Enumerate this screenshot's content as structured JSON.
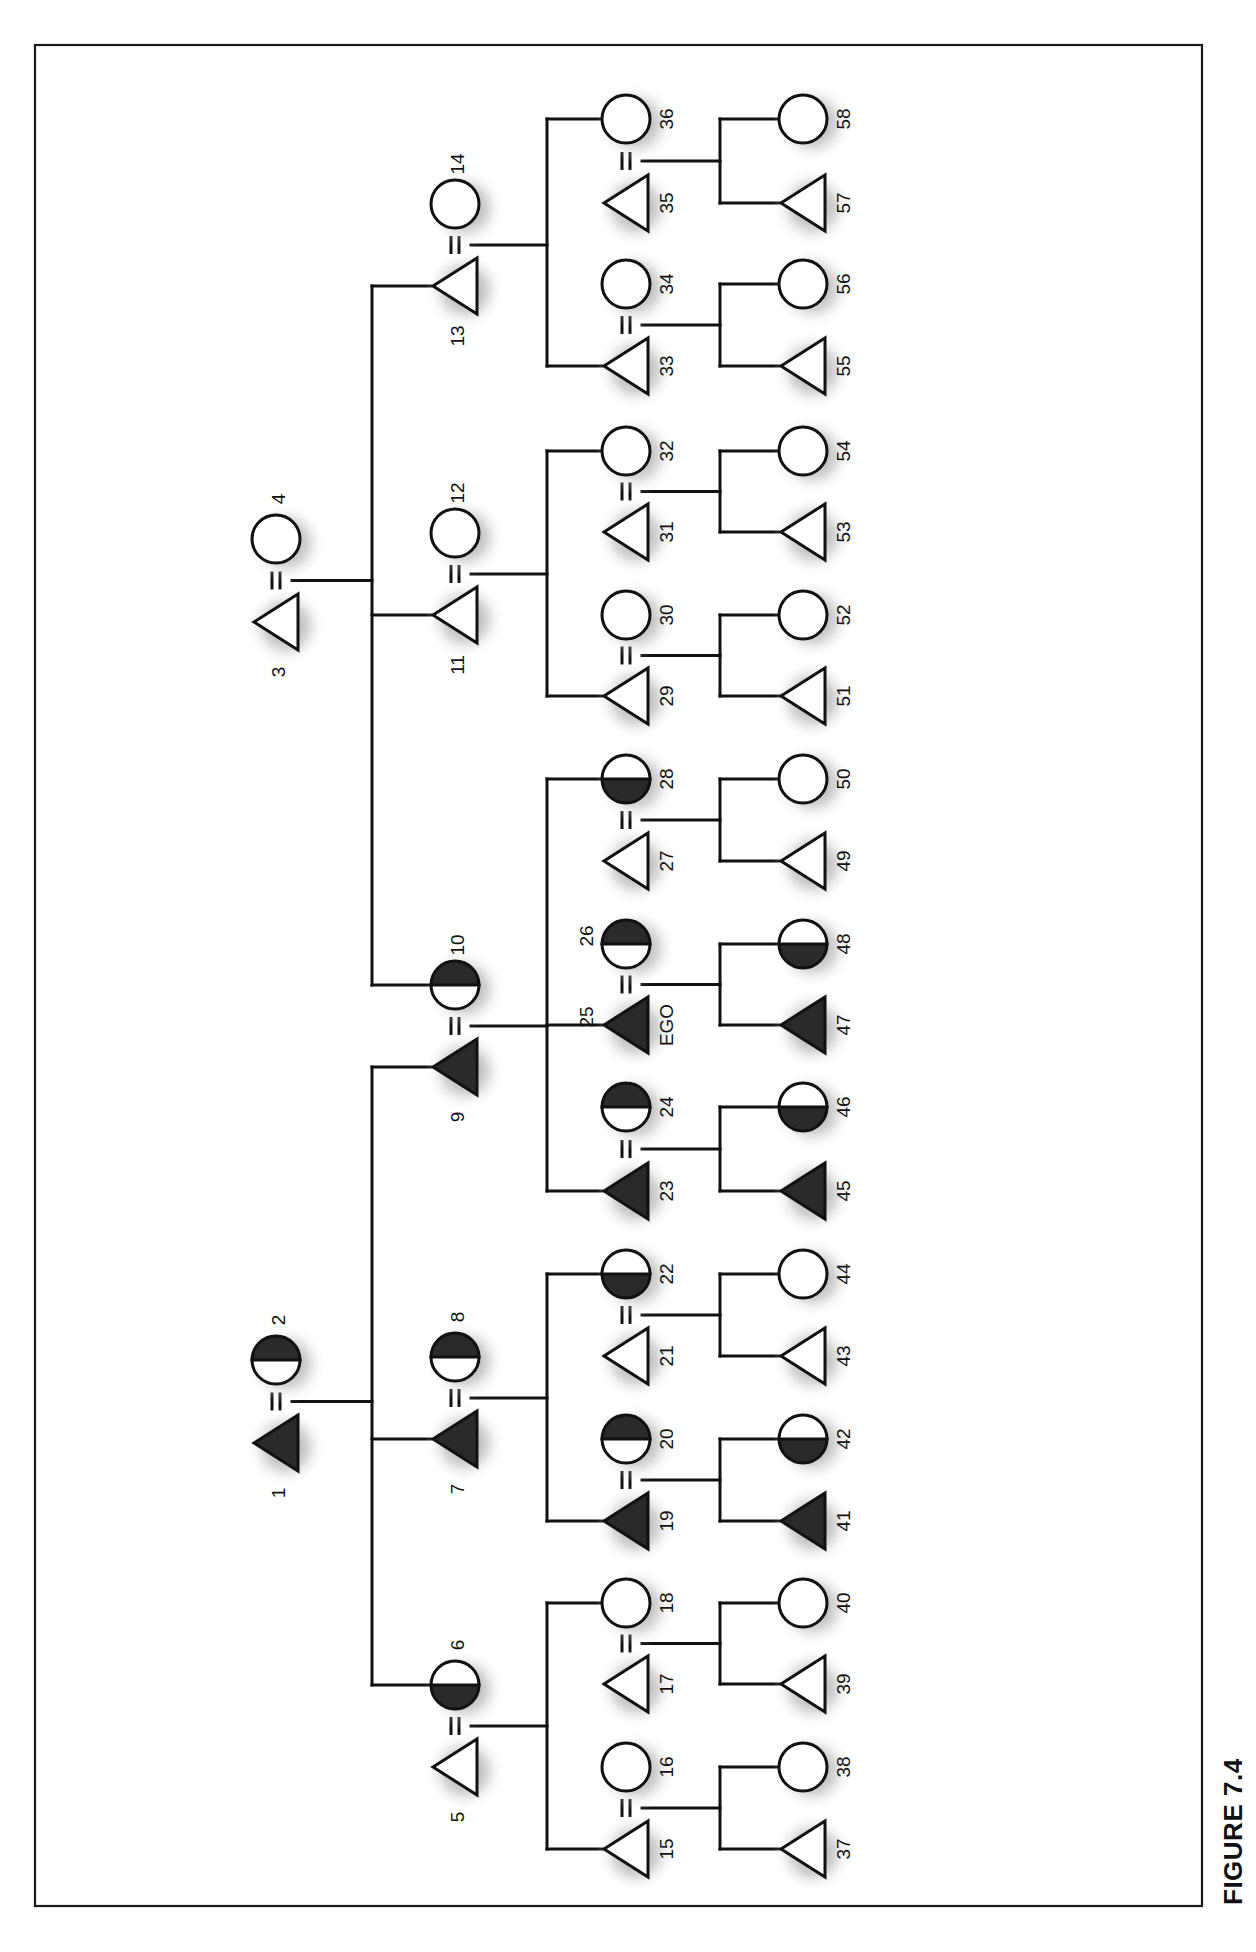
{
  "figure": {
    "caption": "FIGURE 7.4",
    "colors": {
      "ink": "#111111",
      "fill_dark": "#2a2a2a",
      "fill_light": "#ffffff",
      "halo": "#9a9a9a"
    }
  },
  "legend_semantics": {
    "triangle": "male",
    "circle": "female",
    "equals": "marriage",
    "solid": "fully shaded (patrilineal line)",
    "half_top": "top half shaded (in-marrying wife)",
    "half_bottom": "bottom half shaded (daughter of shaded line)"
  },
  "nodes": [
    {
      "id": 1,
      "label": "1",
      "sex": "male",
      "fill": "solid",
      "gen": 1,
      "row": 1443,
      "label_pos": "below"
    },
    {
      "id": 2,
      "label": "2",
      "sex": "female",
      "fill": "half_top",
      "gen": 1,
      "row": 1360,
      "label_pos": "above"
    },
    {
      "id": 3,
      "label": "3",
      "sex": "male",
      "fill": "none",
      "gen": 1,
      "row": 622,
      "label_pos": "below"
    },
    {
      "id": 4,
      "label": "4",
      "sex": "female",
      "fill": "none",
      "gen": 1,
      "row": 539,
      "label_pos": "above"
    },
    {
      "id": 5,
      "label": "5",
      "sex": "male",
      "fill": "none",
      "gen": 2,
      "row": 1767,
      "label_pos": "below"
    },
    {
      "id": 6,
      "label": "6",
      "sex": "female",
      "fill": "half_bottom",
      "gen": 2,
      "row": 1685,
      "label_pos": "above"
    },
    {
      "id": 7,
      "label": "7",
      "sex": "male",
      "fill": "solid",
      "gen": 2,
      "row": 1439,
      "label_pos": "below"
    },
    {
      "id": 8,
      "label": "8",
      "sex": "female",
      "fill": "half_top",
      "gen": 2,
      "row": 1357,
      "label_pos": "above"
    },
    {
      "id": 9,
      "label": "9",
      "sex": "male",
      "fill": "solid",
      "gen": 2,
      "row": 1067,
      "label_pos": "below"
    },
    {
      "id": 10,
      "label": "10",
      "sex": "female",
      "fill": "half_top",
      "gen": 2,
      "row": 985,
      "label_pos": "above"
    },
    {
      "id": 11,
      "label": "11",
      "sex": "male",
      "fill": "none",
      "gen": 2,
      "row": 615,
      "label_pos": "below"
    },
    {
      "id": 12,
      "label": "12",
      "sex": "female",
      "fill": "none",
      "gen": 2,
      "row": 533,
      "label_pos": "above"
    },
    {
      "id": 13,
      "label": "13",
      "sex": "male",
      "fill": "none",
      "gen": 2,
      "row": 286,
      "label_pos": "below"
    },
    {
      "id": 14,
      "label": "14",
      "sex": "female",
      "fill": "none",
      "gen": 2,
      "row": 204,
      "label_pos": "above"
    },
    {
      "id": 15,
      "label": "15",
      "sex": "male",
      "fill": "none",
      "gen": 3,
      "row": 1849,
      "label_pos": "right"
    },
    {
      "id": 16,
      "label": "16",
      "sex": "female",
      "fill": "none",
      "gen": 3,
      "row": 1767,
      "label_pos": "right"
    },
    {
      "id": 17,
      "label": "17",
      "sex": "male",
      "fill": "none",
      "gen": 3,
      "row": 1684,
      "label_pos": "right"
    },
    {
      "id": 18,
      "label": "18",
      "sex": "female",
      "fill": "none",
      "gen": 3,
      "row": 1603,
      "label_pos": "right"
    },
    {
      "id": 19,
      "label": "19",
      "sex": "male",
      "fill": "solid",
      "gen": 3,
      "row": 1521,
      "label_pos": "right"
    },
    {
      "id": 20,
      "label": "20",
      "sex": "female",
      "fill": "half_top",
      "gen": 3,
      "row": 1439,
      "label_pos": "right"
    },
    {
      "id": 21,
      "label": "21",
      "sex": "male",
      "fill": "none",
      "gen": 3,
      "row": 1356,
      "label_pos": "right"
    },
    {
      "id": 22,
      "label": "22",
      "sex": "female",
      "fill": "half_bottom",
      "gen": 3,
      "row": 1274,
      "label_pos": "right"
    },
    {
      "id": 23,
      "label": "23",
      "sex": "male",
      "fill": "solid",
      "gen": 3,
      "row": 1191,
      "label_pos": "right"
    },
    {
      "id": 24,
      "label": "24",
      "sex": "female",
      "fill": "half_top",
      "gen": 3,
      "row": 1107,
      "label_pos": "right"
    },
    {
      "id": 25,
      "label": "25",
      "sex": "male",
      "fill": "solid",
      "gen": 3,
      "row": 1025,
      "label_pos": "left",
      "extra_label": "EGO"
    },
    {
      "id": 26,
      "label": "26",
      "sex": "female",
      "fill": "half_top",
      "gen": 3,
      "row": 944,
      "label_pos": "left"
    },
    {
      "id": 27,
      "label": "27",
      "sex": "male",
      "fill": "none",
      "gen": 3,
      "row": 861,
      "label_pos": "right"
    },
    {
      "id": 28,
      "label": "28",
      "sex": "female",
      "fill": "half_bottom",
      "gen": 3,
      "row": 779,
      "label_pos": "right"
    },
    {
      "id": 29,
      "label": "29",
      "sex": "male",
      "fill": "none",
      "gen": 3,
      "row": 696,
      "label_pos": "right"
    },
    {
      "id": 30,
      "label": "30",
      "sex": "female",
      "fill": "none",
      "gen": 3,
      "row": 615,
      "label_pos": "right"
    },
    {
      "id": 31,
      "label": "31",
      "sex": "male",
      "fill": "none",
      "gen": 3,
      "row": 532,
      "label_pos": "right"
    },
    {
      "id": 32,
      "label": "32",
      "sex": "female",
      "fill": "none",
      "gen": 3,
      "row": 451,
      "label_pos": "right"
    },
    {
      "id": 33,
      "label": "33",
      "sex": "male",
      "fill": "none",
      "gen": 3,
      "row": 366,
      "label_pos": "right"
    },
    {
      "id": 34,
      "label": "34",
      "sex": "female",
      "fill": "none",
      "gen": 3,
      "row": 284,
      "label_pos": "right"
    },
    {
      "id": 35,
      "label": "35",
      "sex": "male",
      "fill": "none",
      "gen": 3,
      "row": 203,
      "label_pos": "right"
    },
    {
      "id": 36,
      "label": "36",
      "sex": "female",
      "fill": "none",
      "gen": 3,
      "row": 119,
      "label_pos": "right"
    },
    {
      "id": 37,
      "label": "37",
      "sex": "male",
      "fill": "none",
      "gen": 4,
      "row": 1849,
      "label_pos": "right"
    },
    {
      "id": 38,
      "label": "38",
      "sex": "female",
      "fill": "none",
      "gen": 4,
      "row": 1767,
      "label_pos": "right"
    },
    {
      "id": 39,
      "label": "39",
      "sex": "male",
      "fill": "none",
      "gen": 4,
      "row": 1684,
      "label_pos": "right"
    },
    {
      "id": 40,
      "label": "40",
      "sex": "female",
      "fill": "none",
      "gen": 4,
      "row": 1603,
      "label_pos": "right"
    },
    {
      "id": 41,
      "label": "41",
      "sex": "male",
      "fill": "solid",
      "gen": 4,
      "row": 1521,
      "label_pos": "right"
    },
    {
      "id": 42,
      "label": "42",
      "sex": "female",
      "fill": "half_bottom",
      "gen": 4,
      "row": 1439,
      "label_pos": "right"
    },
    {
      "id": 43,
      "label": "43",
      "sex": "male",
      "fill": "none",
      "gen": 4,
      "row": 1356,
      "label_pos": "right"
    },
    {
      "id": 44,
      "label": "44",
      "sex": "female",
      "fill": "none",
      "gen": 4,
      "row": 1274,
      "label_pos": "right"
    },
    {
      "id": 45,
      "label": "45",
      "sex": "male",
      "fill": "solid",
      "gen": 4,
      "row": 1191,
      "label_pos": "right"
    },
    {
      "id": 46,
      "label": "46",
      "sex": "female",
      "fill": "half_bottom",
      "gen": 4,
      "row": 1107,
      "label_pos": "right"
    },
    {
      "id": 47,
      "label": "47",
      "sex": "male",
      "fill": "solid",
      "gen": 4,
      "row": 1025,
      "label_pos": "right"
    },
    {
      "id": 48,
      "label": "48",
      "sex": "female",
      "fill": "half_bottom",
      "gen": 4,
      "row": 944,
      "label_pos": "right"
    },
    {
      "id": 49,
      "label": "49",
      "sex": "male",
      "fill": "none",
      "gen": 4,
      "row": 861,
      "label_pos": "right"
    },
    {
      "id": 50,
      "label": "50",
      "sex": "female",
      "fill": "none",
      "gen": 4,
      "row": 779,
      "label_pos": "right"
    },
    {
      "id": 51,
      "label": "51",
      "sex": "male",
      "fill": "none",
      "gen": 4,
      "row": 696,
      "label_pos": "right"
    },
    {
      "id": 52,
      "label": "52",
      "sex": "female",
      "fill": "none",
      "gen": 4,
      "row": 615,
      "label_pos": "right"
    },
    {
      "id": 53,
      "label": "53",
      "sex": "male",
      "fill": "none",
      "gen": 4,
      "row": 532,
      "label_pos": "right"
    },
    {
      "id": 54,
      "label": "54",
      "sex": "female",
      "fill": "none",
      "gen": 4,
      "row": 451,
      "label_pos": "right"
    },
    {
      "id": 55,
      "label": "55",
      "sex": "male",
      "fill": "none",
      "gen": 4,
      "row": 366,
      "label_pos": "right"
    },
    {
      "id": 56,
      "label": "56",
      "sex": "female",
      "fill": "none",
      "gen": 4,
      "row": 284,
      "label_pos": "right"
    },
    {
      "id": 57,
      "label": "57",
      "sex": "male",
      "fill": "none",
      "gen": 4,
      "row": 203,
      "label_pos": "right"
    },
    {
      "id": 58,
      "label": "58",
      "sex": "female",
      "fill": "none",
      "gen": 4,
      "row": 119,
      "label_pos": "right"
    }
  ],
  "marriages": [
    {
      "husband": 1,
      "wife": 2,
      "children": [
        9,
        7,
        6
      ]
    },
    {
      "husband": 3,
      "wife": 4,
      "children": [
        13,
        11,
        10
      ]
    },
    {
      "husband": 5,
      "wife": 6,
      "children": [
        15,
        18
      ]
    },
    {
      "husband": 7,
      "wife": 8,
      "children": [
        19,
        22
      ]
    },
    {
      "husband": 9,
      "wife": 10,
      "children": [
        23,
        25,
        28
      ]
    },
    {
      "husband": 11,
      "wife": 12,
      "children": [
        29,
        32
      ]
    },
    {
      "husband": 13,
      "wife": 14,
      "children": [
        33,
        36
      ]
    },
    {
      "husband": 15,
      "wife": 16,
      "children": [
        37,
        38
      ]
    },
    {
      "husband": 17,
      "wife": 18,
      "children": [
        39,
        40
      ]
    },
    {
      "husband": 19,
      "wife": 20,
      "children": [
        41,
        42
      ]
    },
    {
      "husband": 21,
      "wife": 22,
      "children": [
        43,
        44
      ]
    },
    {
      "husband": 23,
      "wife": 24,
      "children": [
        45,
        46
      ]
    },
    {
      "husband": 25,
      "wife": 26,
      "children": [
        47,
        48
      ]
    },
    {
      "husband": 27,
      "wife": 28,
      "children": [
        49,
        50
      ]
    },
    {
      "husband": 29,
      "wife": 30,
      "children": [
        51,
        52
      ]
    },
    {
      "husband": 31,
      "wife": 32,
      "children": [
        53,
        54
      ]
    },
    {
      "husband": 33,
      "wife": 34,
      "children": [
        55,
        56
      ]
    },
    {
      "husband": 35,
      "wife": 36,
      "children": [
        57,
        58
      ]
    }
  ]
}
